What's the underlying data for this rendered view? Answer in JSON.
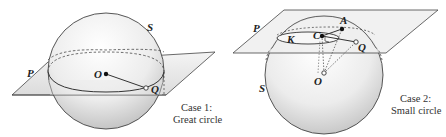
{
  "diagram": {
    "case1": {
      "caption_line1": "Case 1:",
      "caption_line2": "Great circle",
      "labels": {
        "sphere": "S",
        "plane": "P",
        "center": "O",
        "point": "Q"
      }
    },
    "case2": {
      "caption_line1": "Case 2:",
      "caption_line2": "Small circle",
      "labels": {
        "sphere": "S",
        "plane": "P",
        "circle": "K",
        "circle_center": "C",
        "point_a": "A",
        "point_q": "Q",
        "sphere_center": "O"
      }
    },
    "colors": {
      "stroke": "#333333",
      "plane_fill": "#e6e6e6",
      "sphere_light": "#ffffff",
      "sphere_dark": "#bdbdbd"
    }
  }
}
